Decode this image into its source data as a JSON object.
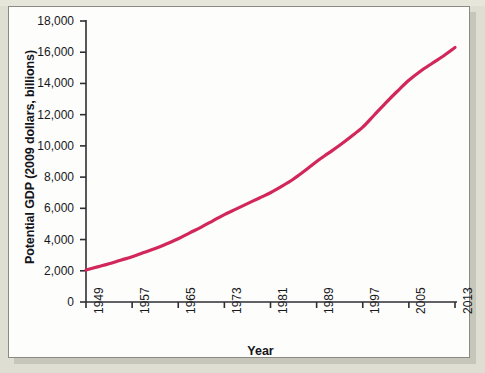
{
  "figure": {
    "background_color": "#dedfd2",
    "plot_background_color": "#fdfdfb",
    "border_color": "#8a8a80"
  },
  "chart_data": {
    "type": "line",
    "title": "",
    "xlabel": "Year",
    "ylabel": "Potential GDP (2009 dollars, billions)",
    "line_color": "#d2275b",
    "line_width": 3.2,
    "grid": false,
    "legend": false,
    "xlim": [
      1949,
      2013
    ],
    "ylim": [
      0,
      18000
    ],
    "x_tick_labels": [
      "1949",
      "1957",
      "1965",
      "1973",
      "1981",
      "1989",
      "1997",
      "2005",
      "2013"
    ],
    "x_ticks": [
      1949,
      1957,
      1965,
      1973,
      1981,
      1989,
      1997,
      2005,
      2013
    ],
    "y_tick_labels": [
      "0",
      "2,000",
      "4,000",
      "6,000",
      "8,000",
      "10,000",
      "12,000",
      "14,000",
      "16,000",
      "18,000"
    ],
    "y_ticks": [
      0,
      2000,
      4000,
      6000,
      8000,
      10000,
      12000,
      14000,
      16000,
      18000
    ],
    "series": [
      {
        "name": "Potential GDP",
        "x": [
          1949,
          1951,
          1953,
          1955,
          1957,
          1959,
          1961,
          1963,
          1965,
          1967,
          1969,
          1971,
          1973,
          1975,
          1977,
          1979,
          1981,
          1983,
          1985,
          1987,
          1989,
          1991,
          1993,
          1995,
          1997,
          1999,
          2001,
          2003,
          2005,
          2007,
          2009,
          2011,
          2013
        ],
        "values": [
          2050,
          2250,
          2450,
          2680,
          2900,
          3170,
          3430,
          3730,
          4050,
          4430,
          4800,
          5200,
          5600,
          5950,
          6300,
          6650,
          7000,
          7420,
          7880,
          8420,
          9000,
          9520,
          10040,
          10600,
          11200,
          11980,
          12760,
          13500,
          14200,
          14780,
          15280,
          15760,
          16300
        ]
      }
    ]
  }
}
